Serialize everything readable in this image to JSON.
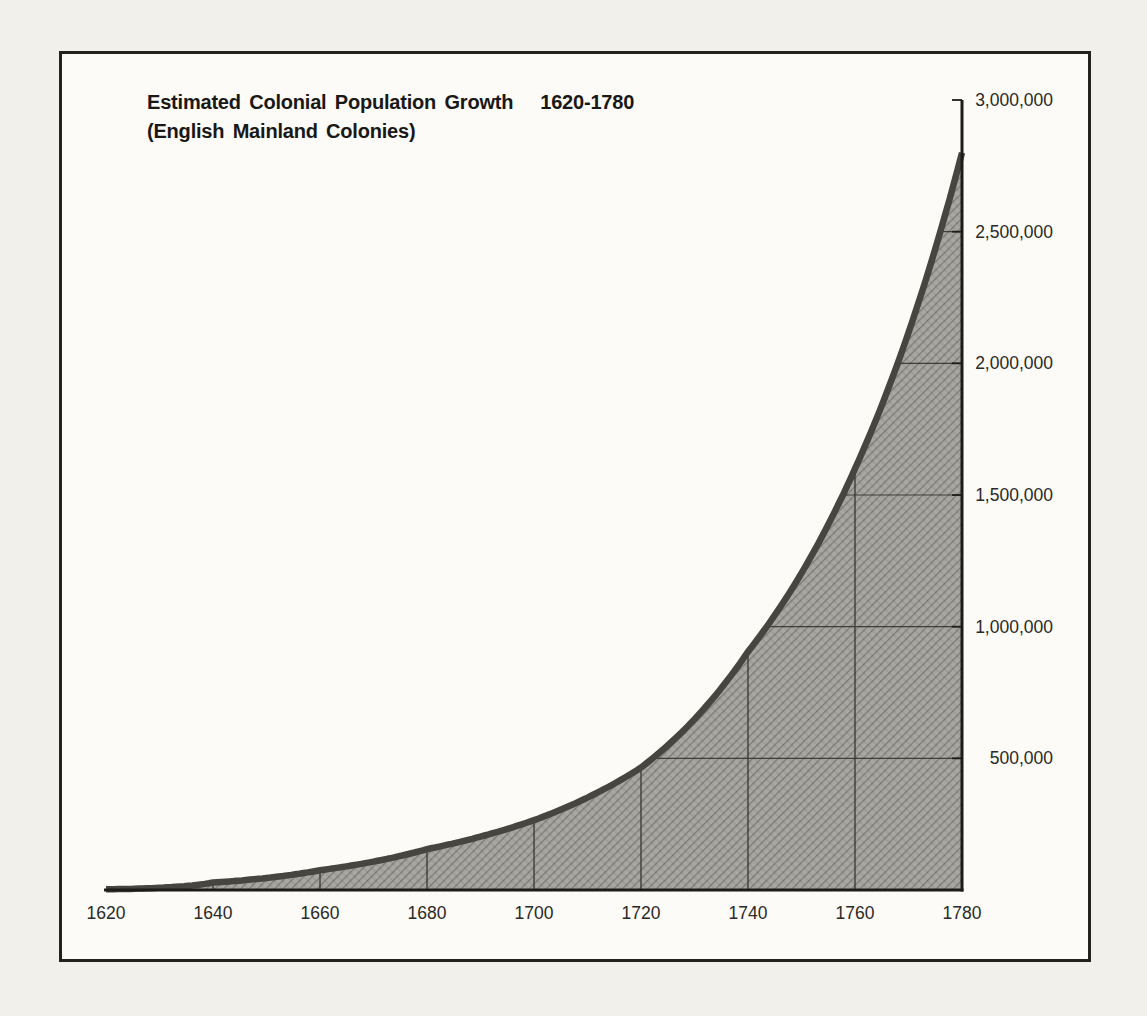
{
  "page": {
    "background": "#f2f0ea",
    "frame_background": "#fcfbf7",
    "frame_border_color": "#23221e"
  },
  "title": {
    "main": "Estimated Colonial Population Growth",
    "range": "1620-1780",
    "subtitle": "(English Mainland Colonies)"
  },
  "chart_data": {
    "type": "area",
    "subtitle": "(English Mainland Colonies)",
    "x": [
      1620,
      1640,
      1660,
      1680,
      1700,
      1720,
      1740,
      1760,
      1780
    ],
    "values": [
      2500,
      28000,
      75000,
      155000,
      265000,
      465000,
      905000,
      1600000,
      2800000
    ],
    "x_tick_labels": [
      "1620",
      "1640",
      "1660",
      "1680",
      "1700",
      "1720",
      "1740",
      "1760",
      "1780"
    ],
    "y_ticks": [
      500000,
      1000000,
      1500000,
      2000000,
      2500000,
      3000000
    ],
    "y_tick_labels": [
      "500,000",
      "1,000,000",
      "1,500,000",
      "2,000,000",
      "2,500,000",
      "3,000,000"
    ],
    "xlim": [
      1620,
      1780
    ],
    "ylim": [
      0,
      3000000
    ],
    "grid": true,
    "legend": false,
    "y_axis_side": "right",
    "colors": {
      "fill_base": "#a8a7a1",
      "hatch_strong": "rgba(52,51,45,0.38)",
      "hatch_weak": "rgba(52,51,45,0.16)",
      "curve_band": "#46453f",
      "grid_line": "#3e3d38",
      "axis_line": "#1d1c1a",
      "label_text": "#2a2926"
    }
  }
}
